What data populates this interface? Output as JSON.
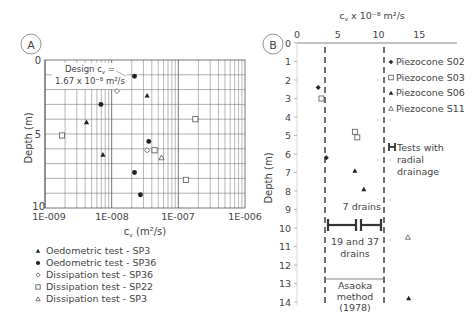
{
  "chart_data": [
    {
      "panel": "A",
      "type": "scatter",
      "title": "",
      "xlabel": "cv (m²/s)",
      "ylabel": "Depth (m)",
      "xscale": "log",
      "xlim": [
        1e-09,
        1e-06
      ],
      "ylim": [
        0,
        10
      ],
      "y_inverted": true,
      "x_ticks": [
        "1E-009",
        "1E-008",
        "1E-007",
        "1E-006"
      ],
      "y_ticks": [
        "0",
        "5",
        "10"
      ],
      "grid": true,
      "annotation": {
        "line1": "Design cv =",
        "line2": "1.67 x 10⁻⁸ m²/s",
        "value": 1.67e-08
      },
      "series": [
        {
          "name": "Oedometric test - SP3",
          "marker": "triangle-filled",
          "points": [
            [
              3.4e-08,
              2.4
            ],
            [
              4.2e-09,
              4.2
            ],
            [
              7.4e-09,
              6.4
            ]
          ]
        },
        {
          "name": "Oedometric test - SP36",
          "marker": "circle-filled",
          "points": [
            [
              2.2e-08,
              1.1
            ],
            [
              6.9e-09,
              3.0
            ],
            [
              3.6e-08,
              5.5
            ],
            [
              2.2e-08,
              7.6
            ],
            [
              2.7e-08,
              9.1
            ]
          ]
        },
        {
          "name": "Dissipation test - SP36",
          "marker": "diamond-open",
          "points": [
            [
              1.2e-08,
              2.1
            ],
            [
              3.4e-08,
              6.1
            ]
          ]
        },
        {
          "name": "Dissipation test - SP22",
          "marker": "square-open",
          "points": [
            [
              1.8e-09,
              5.1
            ],
            [
              1.8e-07,
              4.0
            ],
            [
              4.4e-08,
              6.1
            ],
            [
              1.3e-07,
              8.1
            ]
          ]
        },
        {
          "name": "Dissipation test - SP3",
          "marker": "triangle-open",
          "points": [
            [
              5.6e-08,
              6.6
            ]
          ]
        }
      ],
      "legend_position": "below"
    },
    {
      "panel": "B",
      "type": "scatter",
      "title": "cv x 10⁻⁸ m²/s",
      "xlabel": "cv x 10⁻⁸ m²/s",
      "ylabel": "Depth (m)",
      "xlim": [
        0,
        19
      ],
      "ylim": [
        0,
        14
      ],
      "y_inverted": true,
      "x_ticks": [
        "0",
        "5",
        "10",
        "15"
      ],
      "y_ticks": [
        "0",
        "1",
        "2",
        "3",
        "4",
        "5",
        "6",
        "7",
        "8",
        "9",
        "10",
        "11",
        "12",
        "13",
        "14"
      ],
      "grid": false,
      "dashed_lines_x": [
        3.4,
        10.7
      ],
      "series": [
        {
          "name": "Piezocone S02",
          "marker": "diamond-filled",
          "points": [
            [
              2.6,
              2.4
            ],
            [
              3.6,
              6.2
            ]
          ]
        },
        {
          "name": "Piezocone S03",
          "marker": "square-open",
          "points": [
            [
              3.0,
              3.0
            ],
            [
              7.1,
              4.8
            ],
            [
              7.4,
              5.1
            ]
          ]
        },
        {
          "name": "Piezocone S06",
          "marker": "triangle-filled",
          "points": [
            [
              7.1,
              6.9
            ],
            [
              8.2,
              7.9
            ],
            [
              13.7,
              13.8
            ]
          ]
        },
        {
          "name": "Piezocone S11",
          "marker": "triangle-open",
          "points": [
            [
              13.6,
              10.5
            ]
          ]
        }
      ],
      "ranges": [
        {
          "label": "19 and 37 drains",
          "x": [
            3.6,
            7.2
          ],
          "depth": 9.8
        },
        {
          "label": "7 drains",
          "x": [
            7.6,
            10.3
          ],
          "depth": 9.8
        }
      ],
      "bracket": {
        "label_lines": [
          "Asaoka",
          "method",
          "(1978)"
        ],
        "x": [
          3.4,
          10.7
        ],
        "depth": 13.0
      },
      "legend_extra": {
        "lines": [
          "Tests with",
          "radial",
          "drainage"
        ]
      },
      "legend_position": "right"
    }
  ],
  "panel_labels": {
    "a": "A",
    "b": "B"
  },
  "panelA": {
    "ylabel": "Depth (m)",
    "xlabel_main": "c",
    "xlabel_sub": "v",
    "xlabel_units": "(m²/s)",
    "x_ticks": [
      "1E-009",
      "1E-008",
      "1E-007",
      "1E-006"
    ],
    "y_ticks": [
      "0",
      "5",
      "10"
    ],
    "annot_line1": "Design c",
    "annot_sub": "v",
    "annot_eq": " =",
    "annot_line2": "1.67 x 10⁻⁸ m²/s",
    "legend": [
      {
        "marker": "triangle-filled",
        "label": "Oedometric test - SP3"
      },
      {
        "marker": "circle-filled",
        "label": "Oedometric test - SP36"
      },
      {
        "marker": "diamond-open",
        "label": "Dissipation test - SP36"
      },
      {
        "marker": "square-open",
        "label": "Dissipation test - SP22"
      },
      {
        "marker": "triangle-open",
        "label": "Dissipation test - SP3"
      }
    ]
  },
  "panelB": {
    "title_main": "c",
    "title_sub": "v",
    "title_rest": " x 10⁻⁸ m²/s",
    "ylabel": "Depth (m)",
    "legend": [
      {
        "marker": "diamond-filled",
        "label": "Piezocone S02"
      },
      {
        "marker": "square-open",
        "label": "Piezocone S03"
      },
      {
        "marker": "triangle-filled",
        "label": "Piezocone S06"
      },
      {
        "marker": "triangle-open",
        "label": "Piezocone S11"
      }
    ],
    "legend_radial": [
      "Tests with",
      "radial",
      "drainage"
    ],
    "label_7_drains": "7 drains",
    "label_19_37_line1": "19 and 37",
    "label_19_37_line2": "drains",
    "asaoka": [
      "Asaoka",
      "method",
      "(1978)"
    ]
  }
}
